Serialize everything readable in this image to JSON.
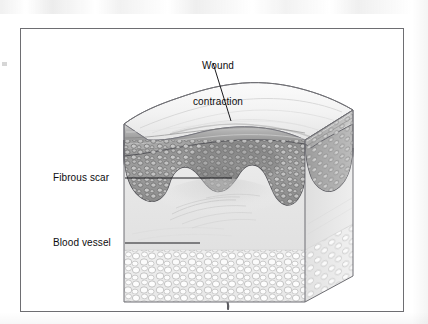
{
  "figure": {
    "title_alt": "Cross-sectional block diagram of healing skin showing wound contraction",
    "frame": {
      "border_color": "#6e6e72",
      "background": "#ffffff"
    },
    "labels": [
      {
        "name": "wound-contraction",
        "text": "Wound\ncontraction",
        "line1": "Wound",
        "line2": "contraction",
        "x": 186,
        "y": 36,
        "align": "center"
      },
      {
        "name": "fibrous-scar",
        "text": "Fibrous scar",
        "x": 53,
        "y": 172,
        "align": "left"
      },
      {
        "name": "blood-vessel",
        "text": "Blood vessel",
        "x": 53,
        "y": 237,
        "align": "left"
      }
    ],
    "leaders": [
      {
        "name": "wound-contraction-leader",
        "from_x": 213,
        "from_y": 63,
        "to_x": 231,
        "to_y": 121
      },
      {
        "name": "fibrous-scar-leader",
        "from_x": 125,
        "from_y": 178,
        "to_x": 232,
        "to_y": 178
      },
      {
        "name": "blood-vessel-leader",
        "from_x": 125,
        "from_y": 243,
        "to_x": 200,
        "to_y": 243
      }
    ],
    "arrows": [
      {
        "name": "contraction-arrow-left",
        "direction": "right",
        "tip_x": 220,
        "tip_y": 126
      },
      {
        "name": "contraction-arrow-right",
        "direction": "left",
        "tip_x": 250,
        "tip_y": 126
      }
    ],
    "layers": [
      {
        "name": "epidermis-keratin",
        "label_alt": "keratinized surface banding",
        "color": "#9a9a9a"
      },
      {
        "name": "epidermis-cellular",
        "label_alt": "cellular epidermis with rete ridges",
        "color": "#8d8d8d"
      },
      {
        "name": "dermis-scar",
        "label_alt": "fibrous scar dermis",
        "color": "#e6e6e6"
      },
      {
        "name": "subcutaneous-fat",
        "label_alt": "adipose tissue",
        "color": "#efefef"
      }
    ],
    "colors": {
      "ink": "#0d0d0f",
      "outline": "#6f6f74",
      "epidermis_dark": "#8a8a8a",
      "epidermis_mid": "#a6a6a6",
      "dermis": "#e9e9e9",
      "fat": "#f1f1f1",
      "vessel": "#5d5d62",
      "arrow": "#121214"
    }
  }
}
